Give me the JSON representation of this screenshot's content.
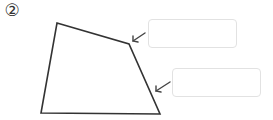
{
  "problem": {
    "number_label": "②"
  },
  "figure": {
    "shape": "quadrilateral",
    "vertices": [
      [
        57,
        23
      ],
      [
        129,
        44
      ],
      [
        160,
        114
      ],
      [
        41,
        113
      ]
    ],
    "stroke_color": "#333333"
  },
  "answer_boxes": [
    {
      "id": "box-1",
      "value": "",
      "points_to": "angle at top-right vertex"
    },
    {
      "id": "box-2",
      "value": "",
      "points_to": "right side"
    }
  ],
  "arrows": [
    {
      "from": [
        145,
        33
      ],
      "to": [
        132,
        42
      ]
    },
    {
      "from": [
        170,
        82
      ],
      "to": [
        155,
        92
      ]
    }
  ]
}
